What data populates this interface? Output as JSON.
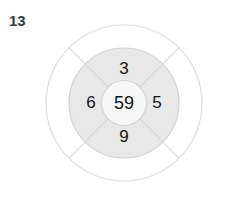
{
  "figure": {
    "label": "13"
  },
  "diagram": {
    "type": "concentric-wheel",
    "center": {
      "value": "59"
    },
    "segments": [
      {
        "position": "top",
        "value": "3"
      },
      {
        "position": "right",
        "value": "5"
      },
      {
        "position": "bottom",
        "value": "9"
      },
      {
        "position": "left",
        "value": "6"
      }
    ],
    "colors": {
      "background": "#ffffff",
      "ring_fill": "#e8e8e8",
      "inner_fill": "#f7f7f7",
      "stroke": "#d2d2d2",
      "outer_stroke": "#dcdcdc",
      "text": "#141414",
      "label_text": "#3a3a3a"
    }
  }
}
